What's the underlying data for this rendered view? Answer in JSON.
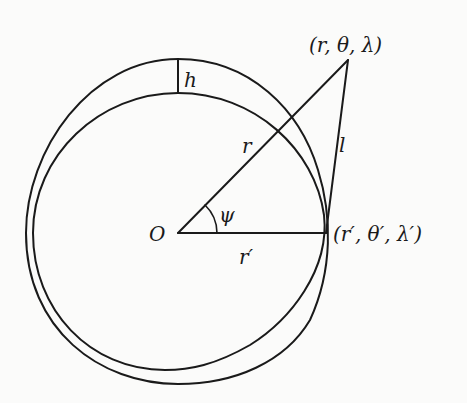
{
  "diagram": {
    "type": "geometry",
    "stroke_color": "#1a1a1a",
    "background": "#fbfbfa",
    "labels": {
      "origin": "O",
      "height": "h",
      "radius": "r",
      "radius_prime": "r′",
      "distance": "l",
      "angle": "ψ",
      "point": "(r, θ, λ)",
      "point_prime": "(r′, θ′, λ′)"
    },
    "points": {
      "origin": [
        178,
        233
      ],
      "point": [
        348,
        60
      ],
      "point_prime": [
        324,
        233
      ]
    }
  }
}
